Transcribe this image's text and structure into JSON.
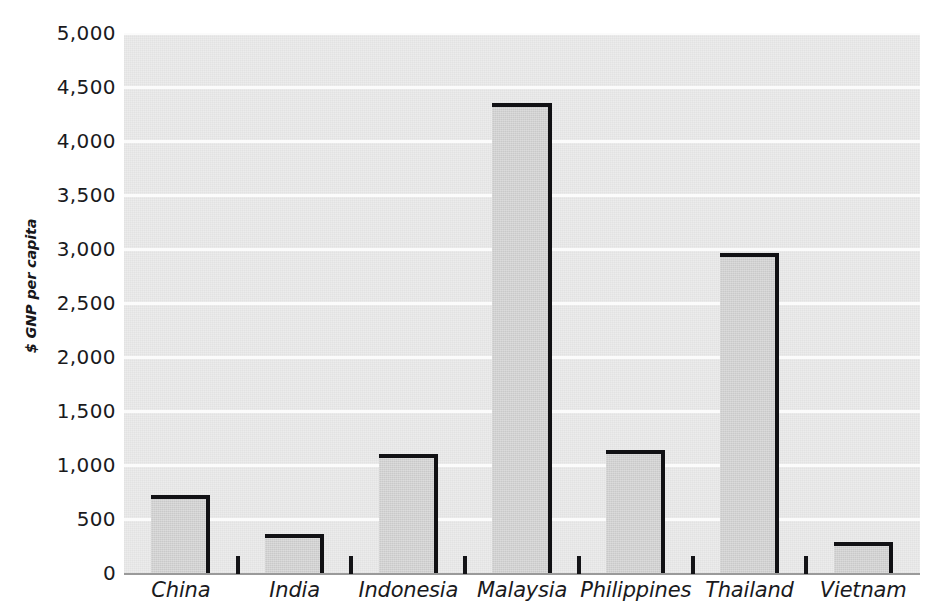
{
  "chart_data": {
    "type": "bar",
    "title": "",
    "subtitle": "",
    "xlabel": "",
    "ylabel": "$ GNP per capita",
    "categories": [
      "China",
      "India",
      "Indonesia",
      "Malaysia",
      "Philippines",
      "Thailand",
      "Vietnam"
    ],
    "values": [
      720,
      360,
      1100,
      4350,
      1140,
      2960,
      290
    ],
    "ylim": [
      0,
      5000
    ],
    "ytick_labels": [
      "5,000",
      "4,500",
      "4,000",
      "3,500",
      "3,000",
      "2,500",
      "2,000",
      "1,500",
      "1,000",
      "500",
      "0"
    ],
    "ytick_values": [
      5000,
      4500,
      4000,
      3500,
      3000,
      2500,
      2000,
      1500,
      1000,
      500,
      0
    ],
    "grid": true,
    "grid_orientation": "horizontal",
    "legend": null,
    "legend_position": "none",
    "annotations": []
  },
  "style": {
    "plot_background": "#ececec",
    "gridline_color": "#fbfbfb",
    "bar_fill": "#c9c9c9",
    "bar_outline": "#111114",
    "axis_color": "#9a9a9a",
    "text_color": "#1a1a1d",
    "page_background": "#ffffff"
  }
}
